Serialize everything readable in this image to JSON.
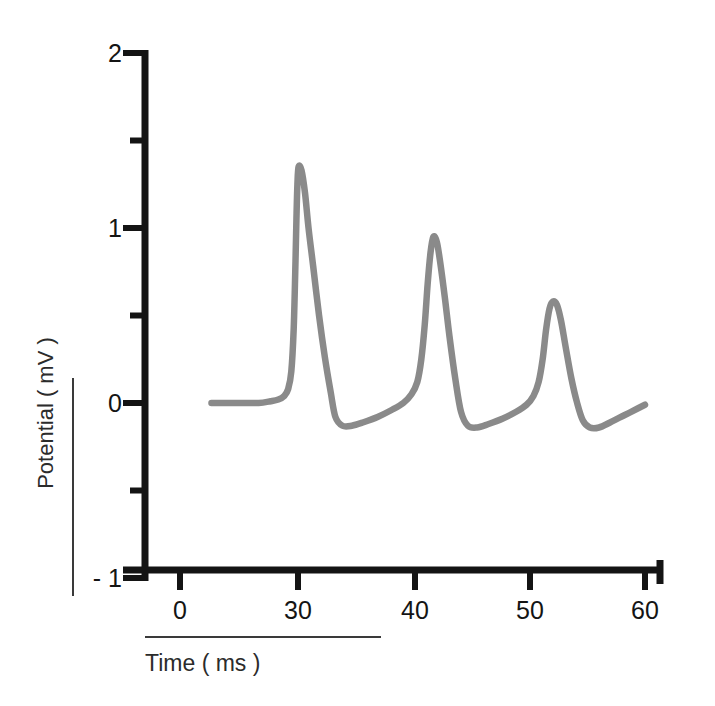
{
  "chart_data": {
    "type": "line",
    "title": "",
    "xlabel": "Time ( ms )",
    "ylabel": "Potential ( mV )",
    "xlim": [
      0,
      60
    ],
    "ylim": [
      -1,
      2
    ],
    "grid": false,
    "legend": "none",
    "axis_note": "x-axis spacing is compressed between 0 and 30 ms",
    "line_color": "#8a8a8a",
    "axis_color": "#141414",
    "xticks": [
      {
        "label": "0",
        "value": 0,
        "px": 180
      },
      {
        "label": "30",
        "value": 30,
        "px": 298
      },
      {
        "label": "40",
        "value": 40,
        "px": 415
      },
      {
        "label": "50",
        "value": 50,
        "px": 530
      },
      {
        "label": "60",
        "value": 60,
        "px": 645
      }
    ],
    "yticks": [
      {
        "label": "2",
        "value": 2,
        "minor": false
      },
      {
        "label": "",
        "value": 1.5,
        "minor": true
      },
      {
        "label": "1",
        "value": 1,
        "minor": false
      },
      {
        "label": "",
        "value": 0.5,
        "minor": true
      },
      {
        "label": "0",
        "value": 0,
        "minor": false
      },
      {
        "label": "",
        "value": -0.5,
        "minor": true
      },
      {
        "label": "- 1",
        "value": -1,
        "minor": false
      }
    ],
    "series": [
      {
        "name": "membrane potential",
        "peaks": [
          {
            "time": 30.0,
            "value": 1.35
          },
          {
            "time": 41.2,
            "value": 0.95
          },
          {
            "time": 51.5,
            "value": 0.58
          }
        ],
        "troughs": [
          {
            "time": 33.2,
            "value": -0.12
          },
          {
            "time": 44.0,
            "value": -0.13
          },
          {
            "time": 54.4,
            "value": -0.14
          }
        ],
        "x": [
          8.0,
          12.0,
          16.0,
          20.0,
          23.0,
          25.0,
          26.5,
          27.5,
          28.3,
          28.9,
          29.3,
          29.6,
          29.85,
          30.05,
          30.3,
          30.6,
          30.9,
          31.3,
          31.8,
          32.3,
          32.8,
          33.2,
          33.8,
          34.6,
          35.6,
          36.8,
          38.0,
          39.0,
          39.7,
          40.2,
          40.55,
          40.85,
          41.1,
          41.35,
          41.6,
          41.9,
          42.2,
          42.6,
          43.0,
          43.5,
          44.0,
          44.6,
          45.4,
          46.4,
          47.6,
          48.8,
          49.7,
          50.3,
          50.75,
          51.1,
          51.4,
          51.7,
          52.0,
          52.35,
          52.7,
          53.1,
          53.6,
          54.1,
          54.6,
          55.2,
          56.0,
          57.0,
          58.2,
          59.4,
          60.0
        ],
        "y": [
          0.0,
          0.0,
          0.0,
          0.0,
          0.01,
          0.02,
          0.04,
          0.08,
          0.18,
          0.42,
          0.75,
          1.05,
          1.25,
          1.35,
          1.33,
          1.2,
          1.0,
          0.78,
          0.5,
          0.26,
          0.06,
          -0.08,
          -0.13,
          -0.13,
          -0.11,
          -0.08,
          -0.04,
          0.0,
          0.05,
          0.12,
          0.25,
          0.45,
          0.68,
          0.86,
          0.95,
          0.92,
          0.8,
          0.6,
          0.38,
          0.14,
          -0.05,
          -0.13,
          -0.14,
          -0.12,
          -0.09,
          -0.05,
          -0.01,
          0.04,
          0.12,
          0.25,
          0.42,
          0.54,
          0.58,
          0.56,
          0.47,
          0.32,
          0.14,
          0.0,
          -0.1,
          -0.14,
          -0.14,
          -0.11,
          -0.07,
          -0.03,
          -0.01
        ]
      }
    ]
  },
  "axis_labels": {
    "y_title": "Potential ( mV )",
    "x_title": "Time ( ms )"
  }
}
